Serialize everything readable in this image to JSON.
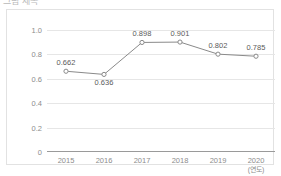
{
  "figure": {
    "clipped_title": "그림 제목",
    "border_color": "#e2e2e2",
    "background": "#ffffff"
  },
  "chart_data": {
    "type": "line",
    "title": "",
    "xlabel": "(연도)",
    "ylabel": "",
    "categories": [
      "2015",
      "2016",
      "2017",
      "2018",
      "2019",
      "2020"
    ],
    "values": [
      0.662,
      0.636,
      0.898,
      0.901,
      0.802,
      0.785
    ],
    "point_labels": [
      "0.662",
      "0.636",
      "0.898",
      "0.901",
      "0.802",
      "0.785"
    ],
    "label_positions": [
      "above",
      "below",
      "above",
      "above",
      "above",
      "above"
    ],
    "ylim": [
      0,
      1.0
    ],
    "yticks": [
      0,
      0.2,
      0.4,
      0.6,
      0.8,
      1.0
    ],
    "ytick_labels": [
      "0",
      "0.2",
      "0.4",
      "0.6",
      "0.8",
      "1.0"
    ],
    "grid": true,
    "legend": "none",
    "line_color": "#8a8a8a",
    "marker": "open-circle",
    "marker_color": "#8a8a8a",
    "axis_color": "#9a9a9a",
    "grid_color": "#e6e6e6",
    "tick_label_color": "#8c8c8c",
    "data_label_color": "#5a5a5a"
  }
}
